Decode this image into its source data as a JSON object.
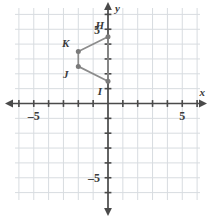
{
  "figure": {
    "axis_labels": {
      "x": "x",
      "y": "y"
    },
    "tick_labels": {
      "x_negative": "–5",
      "x_positive": "5",
      "y_positive": "5",
      "y_negative": "–5"
    },
    "colors": {
      "grid_line": "#d8dce0",
      "axis_line": "#4a4a4a",
      "shape_line": "#8c8c8c",
      "vertex_dot": "#7a7a7a",
      "label_text": "#3b3b3b",
      "background": "#ffffff"
    }
  },
  "chart_data": {
    "type": "scatter",
    "xlabel": "x",
    "ylabel": "y",
    "xlim": [
      -6.2,
      6.5
    ],
    "ylim": [
      -6.6,
      6.4
    ],
    "grid": true,
    "grid_step": 1,
    "legend": "none",
    "xticks": [
      -5,
      5
    ],
    "xtick_labels": [
      "–5",
      "5"
    ],
    "yticks": [
      5,
      -5
    ],
    "ytick_labels": [
      "5",
      "–5"
    ],
    "series": [
      {
        "name": "Quadrilateral HKJI",
        "closed": true,
        "points": [
          {
            "label": "H",
            "x": 0,
            "y": 4.5,
            "label_dx": -0.55,
            "label_dy": 0.72
          },
          {
            "label": "K",
            "x": -2,
            "y": 3.5,
            "label_dx": -0.85,
            "label_dy": 0.55
          },
          {
            "label": "J",
            "x": -2,
            "y": 2.5,
            "label_dx": -0.85,
            "label_dy": -0.55
          },
          {
            "label": "I",
            "x": 0,
            "y": 1.5,
            "label_dx": -0.55,
            "label_dy": -0.72
          }
        ]
      }
    ]
  }
}
